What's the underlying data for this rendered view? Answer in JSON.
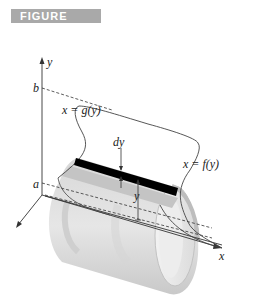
{
  "figure": {
    "title": "FIGURE 7.24a",
    "banner_color": "#a9a9a9",
    "labels": {
      "y_axis": "y",
      "x_axis": "x",
      "b": "b",
      "a": "a",
      "g_curve": "x = g(y)",
      "f_curve": "x = f(y)",
      "dy": "dy",
      "y_height": "y"
    },
    "colors": {
      "shell_light": "#e4e4e4",
      "shell_mid": "#cfcfcf",
      "shell_dark": "#b5b5b5",
      "strip": "#000000",
      "line": "#333333"
    }
  }
}
